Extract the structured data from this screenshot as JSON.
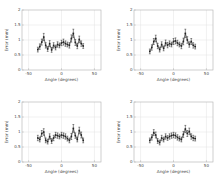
{
  "figure": {
    "background": "#ffffff",
    "rows": 2,
    "cols": 2
  },
  "chart_data": [
    {
      "id": "top-left",
      "type": "scatter",
      "title": "",
      "xlabel": "Angle (degrees)",
      "ylabel": "Error (mm)",
      "xlim": [
        -60,
        60
      ],
      "ylim": [
        0,
        2
      ],
      "xticks": [
        -50,
        0,
        50
      ],
      "yticks": [
        0,
        0.5,
        1,
        1.5,
        2
      ],
      "grid": true,
      "legend": null,
      "error_bars": true,
      "marker": "square",
      "color": "#222222",
      "grid_color": "#e2e2e2",
      "axis_color": "#b0b0b0",
      "tick_text_color": "#4a4a4a",
      "x": [
        -36,
        -33,
        -30,
        -27,
        -24,
        -21,
        -18,
        -15,
        -12,
        -9,
        -6,
        -3,
        0,
        3,
        6,
        9,
        12,
        15,
        18,
        21,
        24,
        27,
        30,
        33
      ],
      "y": [
        0.68,
        0.78,
        0.93,
        1.1,
        0.82,
        0.7,
        0.88,
        0.67,
        0.82,
        0.75,
        0.85,
        0.82,
        0.9,
        0.93,
        0.88,
        0.85,
        0.82,
        1.05,
        1.22,
        0.92,
        0.8,
        1.02,
        0.88,
        0.8
      ],
      "yerr": [
        0.08,
        0.09,
        0.1,
        0.12,
        0.09,
        0.08,
        0.1,
        0.08,
        0.09,
        0.08,
        0.09,
        0.08,
        0.09,
        0.1,
        0.09,
        0.08,
        0.09,
        0.12,
        0.14,
        0.1,
        0.09,
        0.11,
        0.09,
        0.08
      ]
    },
    {
      "id": "top-right",
      "type": "scatter",
      "title": "",
      "xlabel": "Angle (degrees)",
      "ylabel": "Error (mm)",
      "xlim": [
        -60,
        60
      ],
      "ylim": [
        0,
        2
      ],
      "xticks": [
        -50,
        0,
        50
      ],
      "yticks": [
        0,
        0.5,
        1,
        1.5,
        2
      ],
      "grid": true,
      "legend": null,
      "error_bars": true,
      "marker": "square",
      "color": "#222222",
      "grid_color": "#e2e2e2",
      "axis_color": "#b0b0b0",
      "tick_text_color": "#4a4a4a",
      "x": [
        -36,
        -33,
        -30,
        -27,
        -24,
        -21,
        -18,
        -15,
        -12,
        -9,
        -6,
        -3,
        0,
        3,
        6,
        9,
        12,
        15,
        18,
        21,
        24,
        27,
        30,
        33
      ],
      "y": [
        0.62,
        0.75,
        0.95,
        1.05,
        0.8,
        0.68,
        0.85,
        0.72,
        0.9,
        0.83,
        0.88,
        0.85,
        0.95,
        0.97,
        0.9,
        0.85,
        0.8,
        0.95,
        1.22,
        1.0,
        0.85,
        0.95,
        0.82,
        0.78
      ],
      "yerr": [
        0.08,
        0.09,
        0.1,
        0.11,
        0.09,
        0.08,
        0.09,
        0.08,
        0.1,
        0.09,
        0.09,
        0.08,
        0.1,
        0.1,
        0.09,
        0.08,
        0.09,
        0.11,
        0.14,
        0.11,
        0.09,
        0.1,
        0.09,
        0.08
      ]
    },
    {
      "id": "bottom-left",
      "type": "scatter",
      "title": "",
      "xlabel": "Angle (degrees)",
      "ylabel": "Error (mm)",
      "xlim": [
        -60,
        60
      ],
      "ylim": [
        0,
        2
      ],
      "xticks": [
        -50,
        0,
        50
      ],
      "yticks": [
        0,
        0.5,
        1,
        1.5,
        2
      ],
      "grid": true,
      "legend": null,
      "error_bars": true,
      "marker": "square",
      "color": "#222222",
      "grid_color": "#e2e2e2",
      "axis_color": "#b0b0b0",
      "tick_text_color": "#4a4a4a",
      "x": [
        -36,
        -33,
        -30,
        -27,
        -24,
        -21,
        -18,
        -15,
        -12,
        -9,
        -6,
        -3,
        0,
        3,
        6,
        9,
        12,
        15,
        18,
        21,
        24,
        27,
        30,
        33
      ],
      "y": [
        0.8,
        0.75,
        0.95,
        1.0,
        0.72,
        0.68,
        0.85,
        0.7,
        0.8,
        0.9,
        0.88,
        0.85,
        0.9,
        0.88,
        0.85,
        0.78,
        0.72,
        0.85,
        1.12,
        0.88,
        0.75,
        1.05,
        0.9,
        0.72
      ],
      "yerr": [
        0.09,
        0.08,
        0.1,
        0.11,
        0.08,
        0.08,
        0.09,
        0.08,
        0.09,
        0.09,
        0.09,
        0.08,
        0.09,
        0.09,
        0.09,
        0.08,
        0.08,
        0.1,
        0.13,
        0.09,
        0.08,
        0.11,
        0.1,
        0.08
      ]
    },
    {
      "id": "bottom-right",
      "type": "scatter",
      "title": "",
      "xlabel": "Angle (degrees)",
      "ylabel": "Error (mm)",
      "xlim": [
        -60,
        60
      ],
      "ylim": [
        0,
        2
      ],
      "xticks": [
        -50,
        0,
        50
      ],
      "yticks": [
        0,
        0.5,
        1,
        1.5,
        2
      ],
      "grid": true,
      "legend": null,
      "error_bars": true,
      "marker": "square",
      "color": "#222222",
      "grid_color": "#e2e2e2",
      "axis_color": "#b0b0b0",
      "tick_text_color": "#4a4a4a",
      "x": [
        -36,
        -33,
        -30,
        -27,
        -24,
        -21,
        -18,
        -15,
        -12,
        -9,
        -6,
        -3,
        0,
        3,
        6,
        9,
        12,
        15,
        18,
        21,
        24,
        27,
        30,
        33
      ],
      "y": [
        0.72,
        0.82,
        0.98,
        0.9,
        0.7,
        0.65,
        0.8,
        0.75,
        0.85,
        0.8,
        0.85,
        0.88,
        0.9,
        0.88,
        0.82,
        0.78,
        0.75,
        0.92,
        1.1,
        0.95,
        1.02,
        0.85,
        0.8,
        0.78
      ],
      "yerr": [
        0.08,
        0.09,
        0.1,
        0.1,
        0.08,
        0.08,
        0.09,
        0.08,
        0.09,
        0.08,
        0.09,
        0.09,
        0.09,
        0.09,
        0.09,
        0.08,
        0.08,
        0.1,
        0.12,
        0.1,
        0.11,
        0.09,
        0.09,
        0.08
      ]
    }
  ]
}
